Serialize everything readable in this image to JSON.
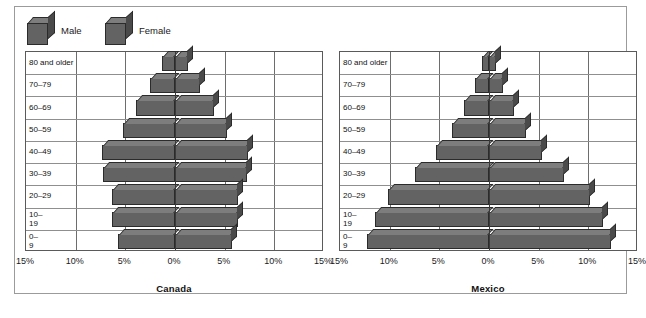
{
  "legend": {
    "items": [
      {
        "key": "male",
        "label": "Male",
        "icon": "cube-icon",
        "color": "#636363"
      },
      {
        "key": "female",
        "label": "Female",
        "icon": "cube-icon",
        "color": "#636363"
      }
    ]
  },
  "axis": {
    "ticks": [
      "15%",
      "10%",
      "5%",
      "0%",
      "5%",
      "10%",
      "15%"
    ],
    "tick_values": [
      15,
      10,
      5,
      0,
      5,
      10,
      15
    ],
    "max_percent": 15
  },
  "age_groups": [
    "80 and older",
    "70–79",
    "60–69",
    "50–59",
    "40–49",
    "30–39",
    "20–29",
    "10–19",
    "0–9"
  ],
  "age_groups_wrapped": [
    "80 and older",
    "70–79",
    "60–69",
    "50–59",
    "40–49",
    "30–39",
    "20–29",
    "10–\n19",
    "0–\n9"
  ],
  "panels": [
    {
      "key": "canada",
      "title": "Canada"
    },
    {
      "key": "mexico",
      "title": "Mexico"
    }
  ],
  "chart_data": {
    "type": "bar",
    "subtype": "population-pyramid",
    "title": "",
    "xlabel": "",
    "ylabel": "",
    "xlim": [
      -15,
      15
    ],
    "xunit": "percent of total population",
    "grid": true,
    "legend_position": "top-left",
    "categories": [
      "80 and older",
      "70–79",
      "60–69",
      "50–59",
      "40–49",
      "30–39",
      "20–29",
      "10–19",
      "0–9"
    ],
    "panels": [
      {
        "name": "Canada",
        "series": [
          {
            "name": "Male",
            "side": "left",
            "values": [
              1.3,
              2.5,
              3.9,
              5.2,
              7.3,
              7.2,
              6.3,
              6.3,
              5.7
            ]
          },
          {
            "name": "Female",
            "side": "right",
            "values": [
              1.3,
              2.5,
              3.9,
              5.2,
              7.3,
              7.2,
              6.3,
              6.3,
              5.7
            ]
          }
        ]
      },
      {
        "name": "Mexico",
        "series": [
          {
            "name": "Male",
            "side": "left",
            "values": [
              0.7,
              1.4,
              2.5,
              3.7,
              5.3,
              7.5,
              10.2,
              11.5,
              12.3
            ]
          },
          {
            "name": "Female",
            "side": "right",
            "values": [
              0.7,
              1.4,
              2.5,
              3.7,
              5.3,
              7.5,
              10.2,
              11.5,
              12.3
            ]
          }
        ]
      }
    ]
  },
  "colors": {
    "bar_front": "#636363",
    "bar_top": "#7d7d7d",
    "bar_side": "#4a4a4a",
    "bar_edge": "#2b2b2b",
    "grid": "#8f8f8f",
    "frame": "#5a5a5a",
    "figure_border": "#9b9b9b",
    "text": "#1a1a1a",
    "background": "#ffffff"
  }
}
